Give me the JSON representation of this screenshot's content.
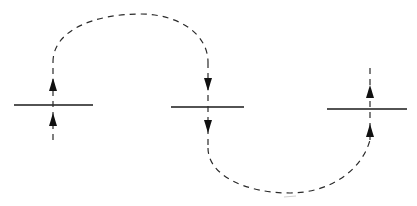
{
  "diagram": {
    "colors": {
      "line": "#1a1a1a",
      "dash": "#2a2a2a",
      "arrow": "#111111",
      "background": "#ffffff"
    },
    "levels": [
      {
        "id": "left",
        "x1": 14,
        "x2": 93,
        "y": 105,
        "axis_x": 53
      },
      {
        "id": "middle",
        "x1": 171,
        "x2": 244,
        "y": 107,
        "axis_x": 208
      },
      {
        "id": "right",
        "x1": 327,
        "x2": 407,
        "y": 109,
        "axis_x": 370
      }
    ],
    "paths": [
      {
        "id": "upper-arc",
        "from": "left",
        "to": "middle",
        "direction": "clockwise-over-top",
        "peak_y": 14
      },
      {
        "id": "lower-arc",
        "from": "middle",
        "to": "right",
        "direction": "under-bottom",
        "trough_y": 193
      }
    ],
    "arrows": [
      {
        "id": "left-upper",
        "x": 53,
        "y": 85,
        "direction": "up"
      },
      {
        "id": "left-lower",
        "x": 53,
        "y": 120,
        "direction": "up"
      },
      {
        "id": "middle-upper",
        "x": 208,
        "y": 84,
        "direction": "down"
      },
      {
        "id": "middle-lower",
        "x": 208,
        "y": 126,
        "direction": "down"
      },
      {
        "id": "right-upper",
        "x": 370,
        "y": 92,
        "direction": "up"
      },
      {
        "id": "right-lower",
        "x": 370,
        "y": 131,
        "direction": "up"
      }
    ]
  }
}
